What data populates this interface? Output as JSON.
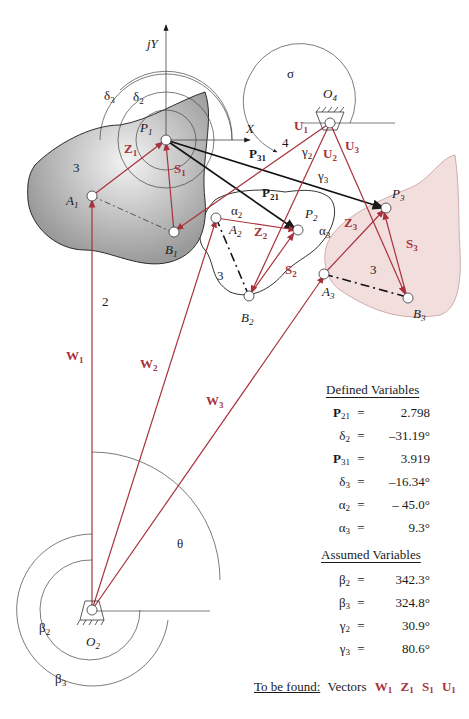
{
  "figure": {
    "axes": {
      "y_label": "jY",
      "x_label": "X"
    },
    "points": [
      "P1",
      "P2",
      "P3",
      "A1",
      "A2",
      "A3",
      "B1",
      "B2",
      "B3",
      "O2",
      "O4"
    ],
    "links": [
      "2",
      "3",
      "3",
      "3",
      "4"
    ],
    "vectors": [
      "W1",
      "W2",
      "W3",
      "Z1",
      "Z2",
      "Z3",
      "S1",
      "S2",
      "S3",
      "U1",
      "U2",
      "U3",
      "P21",
      "P31"
    ],
    "angles": [
      "δ2",
      "δ3",
      "α2",
      "α3",
      "β2",
      "β3",
      "γ2",
      "γ3",
      "θ",
      "σ"
    ],
    "colors": {
      "vector_red": "#a8323c",
      "coupler_gray": "#a9a9a9",
      "coupler_pink": "#f3dede",
      "ink": "#1a1a1a"
    }
  },
  "defined": {
    "title": "Defined Variables",
    "rows": [
      {
        "sym": "P",
        "sub": "21",
        "bold": true,
        "eq": "=",
        "val": "2.798"
      },
      {
        "sym": "δ",
        "sub": "2",
        "bold": false,
        "eq": "=",
        "val": "–31.19°"
      },
      {
        "sym": "P",
        "sub": "31",
        "bold": true,
        "eq": "=",
        "val": "3.919"
      },
      {
        "sym": "δ",
        "sub": "3",
        "bold": false,
        "eq": "=",
        "val": "–16.34°"
      },
      {
        "sym": "α",
        "sub": "2",
        "bold": false,
        "eq": "=",
        "val": "– 45.0°"
      },
      {
        "sym": "α",
        "sub": "3",
        "bold": false,
        "eq": "=",
        "val": "9.3°"
      }
    ]
  },
  "assumed": {
    "title": "Assumed Variables",
    "rows": [
      {
        "sym": "β",
        "sub": "2",
        "eq": "=",
        "val": "342.3°"
      },
      {
        "sym": "β",
        "sub": "3",
        "eq": "=",
        "val": "324.8°"
      },
      {
        "sym": "γ",
        "sub": "2",
        "eq": "=",
        "val": "30.9°"
      },
      {
        "sym": "γ",
        "sub": "3",
        "eq": "=",
        "val": "80.6°"
      }
    ]
  },
  "to_be_found": {
    "label": "To be found:",
    "text": "Vectors",
    "vectors": [
      {
        "sym": "W",
        "sub": "1"
      },
      {
        "sym": "Z",
        "sub": "1"
      },
      {
        "sym": "S",
        "sub": "1"
      },
      {
        "sym": "U",
        "sub": "1"
      }
    ]
  }
}
